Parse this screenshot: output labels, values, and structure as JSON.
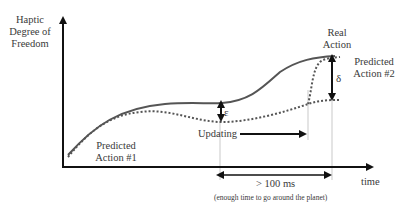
{
  "diagram": {
    "y_axis_label": [
      "Haptic",
      "Degree of",
      "Freedom"
    ],
    "x_axis_label": "time",
    "labels": {
      "real_action": [
        "Real",
        "Action"
      ],
      "predicted_action_1": [
        "Predicted",
        "Action #1"
      ],
      "predicted_action_2": [
        "Predicted",
        "Action #2"
      ],
      "updating": "Updating",
      "epsilon": "ε",
      "delta": "δ",
      "latency": "> 100 ms",
      "latency_note": "(enough time to go around the planet)"
    },
    "colors": {
      "real_curve": "#555555",
      "predicted_curve": "#555555",
      "axes": "#111111",
      "guides": "#bbbbbb"
    }
  }
}
